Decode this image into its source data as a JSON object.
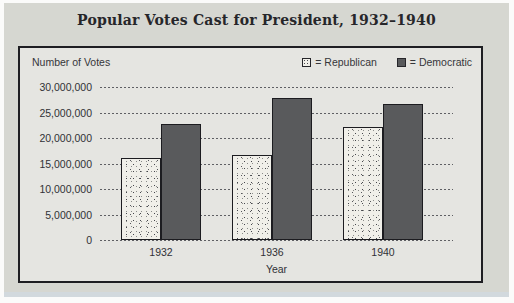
{
  "page": {
    "title": "Popular Votes Cast for President, 1932–1940"
  },
  "chart": {
    "y_axis_title": "Number of Votes",
    "x_axis_title": "Year",
    "legend": [
      {
        "label": "= Republican",
        "swatch": "stippled-light-square-icon"
      },
      {
        "label": "= Democratic",
        "swatch": "solid-dark-square-icon"
      }
    ]
  },
  "chart_data": {
    "type": "bar",
    "title": "Popular Votes Cast for President, 1932–1940",
    "xlabel": "Year",
    "ylabel": "Number of Votes",
    "categories": [
      "1932",
      "1936",
      "1940"
    ],
    "series": [
      {
        "name": "Republican",
        "style": "stippled-light",
        "values": [
          16000000,
          16750000,
          22250000
        ]
      },
      {
        "name": "Democratic",
        "style": "solid-dark",
        "values": [
          22750000,
          27750000,
          26750000
        ]
      }
    ],
    "ylim": [
      0,
      30000000
    ],
    "ytick_interval": 5000000,
    "ytick_labels": [
      "0",
      "5,000,000",
      "10,000,000",
      "15,000,000",
      "20,000,000",
      "25,000,000",
      "30,000,000"
    ],
    "grid": "dashed-horizontal-on",
    "legend_position": "top-right",
    "colors": {
      "card_background": "#d6d7d1",
      "panel_background": "#e5e5e1",
      "republican_fill": "#f0efe9",
      "democratic_fill": "#595a5c",
      "bar_border": "#1c1c20",
      "panel_border": "#1e1e22"
    }
  }
}
